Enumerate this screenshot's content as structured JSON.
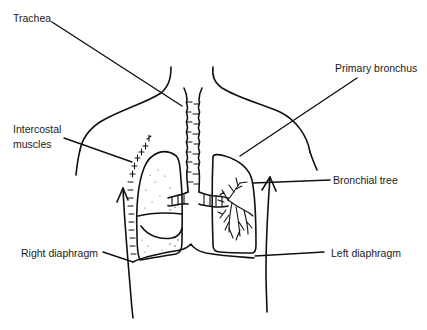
{
  "figure": {
    "labels": {
      "trachea": "Trachea",
      "intercostal_line1": "Intercostal",
      "intercostal_line2": "muscles",
      "primary_bronchus": "Primary bronchus",
      "bronchial_tree": "Bronchial tree",
      "right_diaphragm": "Right diaphragm",
      "left_diaphragm": "Left diaphragm"
    },
    "colors": {
      "ink": "#111111",
      "paper": "#ffffff",
      "label_text": "#1a1a1a"
    }
  }
}
